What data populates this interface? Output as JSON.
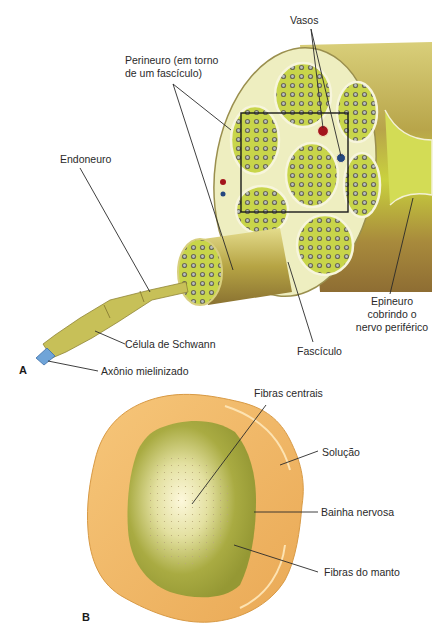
{
  "figure_a": {
    "panel_label": "A",
    "labels": {
      "vasos": "Vasos",
      "perineuro_line1": "Perineuro (em torno",
      "perineuro_line2": "de um fascículo)",
      "endoneuro": "Endoneuro",
      "celula_schwann": "Célula de Schwann",
      "axonio": "Axônio mielinizado",
      "fasciculo": "Fascículo",
      "epineuro_line1": "Epineuro",
      "epineuro_line2": "cobrindo o",
      "epineuro_line3": "nervo periférico"
    }
  },
  "figure_b": {
    "panel_label": "B",
    "labels": {
      "fibras_centrais": "Fibras centrais",
      "solucao": "Solução",
      "bainha_nervosa": "Bainha nervosa",
      "fibras_manto": "Fibras do manto"
    }
  },
  "colors": {
    "nerve_olive": "#b7a93c",
    "fascicle_green": "#c9d64a",
    "perineurium_cream": "#efeec0",
    "vessel_red": "#a3141b",
    "vessel_blue": "#24477f",
    "axon_blue": "#6fa4d8",
    "solution_orange": "#f1b86a",
    "core_green": "#9fa23b",
    "core_light": "#fbf5d6"
  }
}
